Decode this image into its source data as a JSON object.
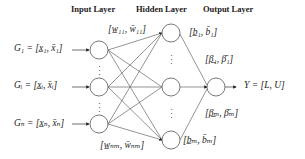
{
  "headers": {
    "input": "Input Layer",
    "hidden": "Hidden Layer",
    "output": "Output Layer"
  },
  "inputs": [
    {
      "text": "G₁ = [x̲₁, x̄₁]"
    },
    {
      "text": "Gᵢ = [x̲ᵢ, x̄ᵢ]"
    },
    {
      "text": "Gₙ = [x̲ₙ, x̄ₙ]"
    }
  ],
  "weights": {
    "top": "[w̲₁₁, w̄₁₁]",
    "bottom": "[w̲ₙₘ, w̄ₙₘ]"
  },
  "biases": {
    "top": "[b̲₁, b̄₁]",
    "bottom": "[b̲ₘ, b̄ₘ]"
  },
  "betas": {
    "top": "[β̲₁, β̄₁]",
    "bottom": "[β̲ₘ, β̄ₘ]"
  },
  "output": {
    "text": "Y = [L, U]"
  },
  "colors": {
    "stroke": "#555555",
    "text": "#222222"
  }
}
